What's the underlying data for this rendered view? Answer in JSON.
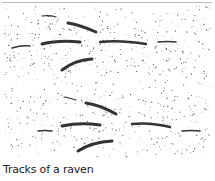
{
  "illustration": {
    "subject": "raven-tracks-stipple-drawing",
    "ink_color": "#333333"
  },
  "caption": "Tracks of a raven"
}
